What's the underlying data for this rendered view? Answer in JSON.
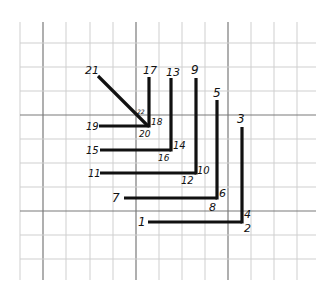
{
  "diagram": {
    "colors": {
      "background": "#ffffff",
      "grid_minor": "#cfcfcf",
      "grid_major": "#7a7a7a",
      "ink": "#111111"
    },
    "grid": {
      "left": 20,
      "right": 316,
      "top": 22,
      "bottom": 280,
      "vertical_lines": [
        20,
        43,
        66,
        90,
        113,
        136,
        159,
        182,
        205,
        228,
        251,
        274,
        297
      ],
      "vertical_major": [
        43,
        136,
        228
      ],
      "horizontal_lines": [
        43,
        67,
        91,
        115,
        139,
        163,
        187,
        211,
        235,
        259
      ],
      "horizontal_major": [
        115,
        211
      ]
    },
    "segments": [
      {
        "id": "seg-1-2",
        "x1": 148,
        "y1": 222,
        "x2": 242,
        "y2": 222
      },
      {
        "id": "seg-3-4",
        "x1": 242,
        "y1": 127,
        "x2": 242,
        "y2": 223.5
      },
      {
        "id": "seg-5-6",
        "x1": 217,
        "y1": 100,
        "x2": 217,
        "y2": 199.5
      },
      {
        "id": "seg-7-8",
        "x1": 124,
        "y1": 198,
        "x2": 217,
        "y2": 198
      },
      {
        "id": "seg-9-10",
        "x1": 196,
        "y1": 78,
        "x2": 196,
        "y2": 174.5
      },
      {
        "id": "seg-11-12",
        "x1": 100,
        "y1": 173,
        "x2": 196,
        "y2": 173
      },
      {
        "id": "seg-13-14",
        "x1": 171,
        "y1": 78,
        "x2": 171,
        "y2": 151.5
      },
      {
        "id": "seg-15-16",
        "x1": 100,
        "y1": 150,
        "x2": 171,
        "y2": 150
      },
      {
        "id": "seg-17-18",
        "x1": 149,
        "y1": 77,
        "x2": 149,
        "y2": 127.5
      },
      {
        "id": "seg-19-20",
        "x1": 99,
        "y1": 126,
        "x2": 149,
        "y2": 126
      },
      {
        "id": "seg-21-22",
        "x1": 98,
        "y1": 76,
        "x2": 148,
        "y2": 126
      }
    ],
    "labels": [
      {
        "text": "1",
        "x": 138,
        "y": 226,
        "size": 12
      },
      {
        "text": "2",
        "x": 244,
        "y": 232,
        "size": 11
      },
      {
        "text": "3",
        "x": 237,
        "y": 123,
        "size": 12
      },
      {
        "text": "4",
        "x": 244,
        "y": 218,
        "size": 11
      },
      {
        "text": "5",
        "x": 213,
        "y": 97,
        "size": 12
      },
      {
        "text": "6",
        "x": 219,
        "y": 197,
        "size": 11
      },
      {
        "text": "7",
        "x": 112,
        "y": 202,
        "size": 12
      },
      {
        "text": "8",
        "x": 209,
        "y": 211,
        "size": 11
      },
      {
        "text": "9",
        "x": 191,
        "y": 74,
        "size": 12
      },
      {
        "text": "10",
        "x": 197,
        "y": 174,
        "size": 10
      },
      {
        "text": "11",
        "x": 88,
        "y": 177,
        "size": 10
      },
      {
        "text": "12",
        "x": 181,
        "y": 184,
        "size": 10
      },
      {
        "text": "13",
        "x": 166,
        "y": 76,
        "size": 11
      },
      {
        "text": "14",
        "x": 173,
        "y": 149,
        "size": 10
      },
      {
        "text": "15",
        "x": 86,
        "y": 154,
        "size": 10
      },
      {
        "text": "16",
        "x": 158,
        "y": 161,
        "size": 9
      },
      {
        "text": "17",
        "x": 143,
        "y": 74,
        "size": 11
      },
      {
        "text": "18",
        "x": 151,
        "y": 125,
        "size": 9
      },
      {
        "text": "19",
        "x": 86,
        "y": 130,
        "size": 10
      },
      {
        "text": "20",
        "x": 139,
        "y": 137,
        "size": 9
      },
      {
        "text": "21",
        "x": 85,
        "y": 74,
        "size": 11
      },
      {
        "text": "22",
        "x": 137,
        "y": 114,
        "size": 6
      }
    ]
  }
}
